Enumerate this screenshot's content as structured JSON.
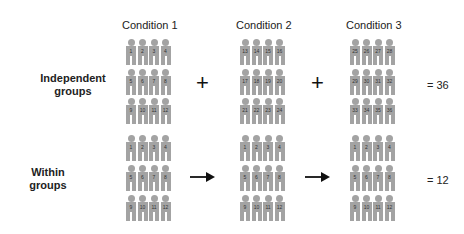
{
  "conditions": [
    "Condition 1",
    "Condition 2",
    "Condition 3"
  ],
  "rows": [
    {
      "label_line1": "Independent",
      "label_line2": "groups",
      "operator": "+",
      "operator_type": "plus",
      "result": "= 36",
      "groups": [
        [
          1,
          2,
          3,
          4,
          5,
          6,
          7,
          8,
          9,
          10,
          11,
          12
        ],
        [
          13,
          14,
          15,
          16,
          17,
          18,
          19,
          20,
          21,
          22,
          23,
          24
        ],
        [
          25,
          26,
          27,
          28,
          29,
          30,
          31,
          32,
          33,
          34,
          35,
          36
        ]
      ]
    },
    {
      "label_line1": "Within",
      "label_line2": "groups",
      "operator": "→",
      "operator_type": "arrow",
      "result": "= 12",
      "groups": [
        [
          1,
          2,
          3,
          4,
          5,
          6,
          7,
          8,
          9,
          10,
          11,
          12
        ],
        [
          1,
          2,
          3,
          4,
          5,
          6,
          7,
          8,
          9,
          10,
          11,
          12
        ],
        [
          1,
          2,
          3,
          4,
          5,
          6,
          7,
          8,
          9,
          10,
          11,
          12
        ]
      ]
    }
  ],
  "colors": {
    "figure": "#a3a3a3",
    "text": "#222222"
  }
}
